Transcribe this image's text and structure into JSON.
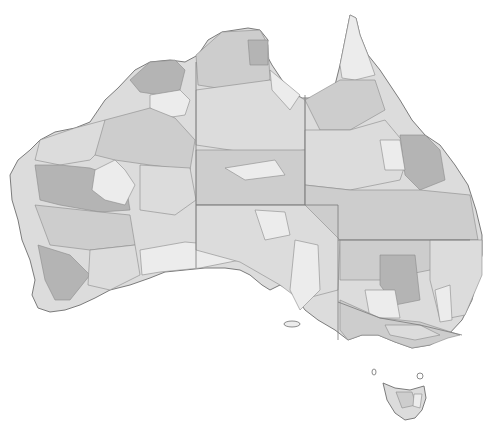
{
  "map": {
    "subject": "Australia",
    "style": "greyscale choropleth of catchment / drainage regions with state borders",
    "colors": {
      "background": "#ffffff",
      "shade_light": "#ececec",
      "shade_mid_light": "#dcdcdc",
      "shade_mid": "#cdcdcd",
      "shade_dark": "#b4b4b4",
      "border": "#7a7a7a",
      "coastline": "#6e6e6e"
    },
    "states": [
      "Western Australia",
      "Northern Territory",
      "Queensland",
      "South Australia",
      "New South Wales",
      "Victoria",
      "Tasmania"
    ],
    "regions": [
      {
        "name": "wa-north-kimberley",
        "shade": "shade_dark"
      },
      {
        "name": "wa-kimberley-inland",
        "shade": "shade_light"
      },
      {
        "name": "wa-pilbara-coast",
        "shade": "shade_mid_light"
      },
      {
        "name": "wa-great-sandy",
        "shade": "shade_mid"
      },
      {
        "name": "wa-gascoyne",
        "shade": "shade_dark"
      },
      {
        "name": "wa-central-light",
        "shade": "shade_light"
      },
      {
        "name": "wa-gibson",
        "shade": "shade_mid_light"
      },
      {
        "name": "wa-midwest",
        "shade": "shade_mid"
      },
      {
        "name": "wa-southwest",
        "shade": "shade_dark"
      },
      {
        "name": "wa-goldfields",
        "shade": "shade_mid_light"
      },
      {
        "name": "nullarbor",
        "shade": "shade_light"
      },
      {
        "name": "nt-top-end",
        "shade": "shade_mid"
      },
      {
        "name": "nt-arnhem-dark",
        "shade": "shade_dark"
      },
      {
        "name": "nt-central",
        "shade": "shade_mid_light"
      },
      {
        "name": "nt-south",
        "shade": "shade_mid"
      },
      {
        "name": "qld-cape-york",
        "shade": "shade_light"
      },
      {
        "name": "qld-gulf",
        "shade": "shade_mid"
      },
      {
        "name": "qld-gulf-light",
        "shade": "shade_light"
      },
      {
        "name": "qld-central-west",
        "shade": "shade_mid_light"
      },
      {
        "name": "qld-east-dark",
        "shade": "shade_dark"
      },
      {
        "name": "qld-southwest",
        "shade": "shade_mid"
      },
      {
        "name": "sa-north",
        "shade": "shade_mid_light"
      },
      {
        "name": "sa-lake-eyre-light",
        "shade": "shade_light"
      },
      {
        "name": "sa-gulfs",
        "shade": "shade_light"
      },
      {
        "name": "nsw-west",
        "shade": "shade_mid"
      },
      {
        "name": "nsw-central-dark",
        "shade": "shade_dark"
      },
      {
        "name": "nsw-riverina-light",
        "shade": "shade_light"
      },
      {
        "name": "nsw-coast",
        "shade": "shade_mid_light"
      },
      {
        "name": "vic",
        "shade": "shade_mid"
      },
      {
        "name": "tas",
        "shade": "shade_mid_light"
      }
    ]
  }
}
